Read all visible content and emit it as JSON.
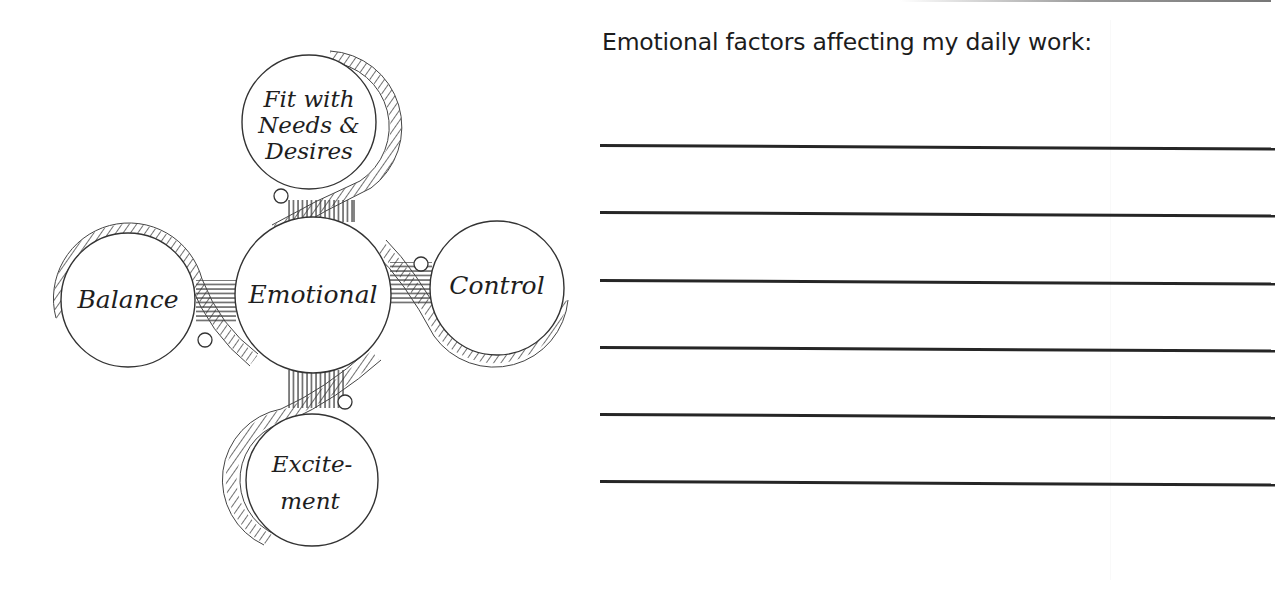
{
  "diagram": {
    "center": {
      "label": "Emotional"
    },
    "nodes": [
      {
        "id": "fit",
        "lines": [
          "Fit with",
          "Needs &",
          "Desires"
        ]
      },
      {
        "id": "balance",
        "lines": [
          "Balance"
        ]
      },
      {
        "id": "control",
        "lines": [
          "Control"
        ]
      },
      {
        "id": "excitement",
        "lines": [
          "Excite-",
          "ment"
        ]
      }
    ]
  },
  "worksheet": {
    "prompt": "Emotional factors affecting my daily work:",
    "line_count": 6,
    "lines": [
      "",
      "",
      "",
      "",
      "",
      ""
    ]
  },
  "colors": {
    "ink": "#262626",
    "paper": "#ffffff"
  }
}
